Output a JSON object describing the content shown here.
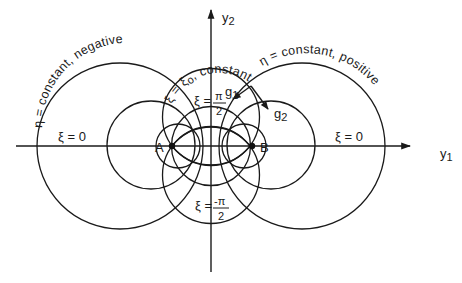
{
  "diagram": {
    "type": "bipolar-coordinate-system",
    "axes": {
      "horizontal_label": "y",
      "horizontal_sub": "1",
      "vertical_label": "y",
      "vertical_sub": "2"
    },
    "points": {
      "A": "A",
      "B": "B"
    },
    "labels": {
      "eta_negative": "η = constant, negative",
      "eta_positive": "η = constant, positive",
      "xi_zero_left": "ξ = 0",
      "xi_zero_right": "ξ = 0",
      "xi_const": "ξ = ξ",
      "xi_const_sub": "o",
      "xi_const_suffix": ", constant",
      "xi_pi2_lhs": "ξ =",
      "xi_pi2_num": "π",
      "xi_pi2_den": "2",
      "xi_mpi2_lhs": "ξ =",
      "xi_mpi2_num": "-π",
      "xi_mpi2_den": "2"
    },
    "vectors": {
      "g1": "g",
      "g1_sub": "1",
      "g2": "g",
      "g2_sub": "2"
    },
    "colors": {
      "ink": "#1a1a1a",
      "background": "#ffffff"
    }
  }
}
